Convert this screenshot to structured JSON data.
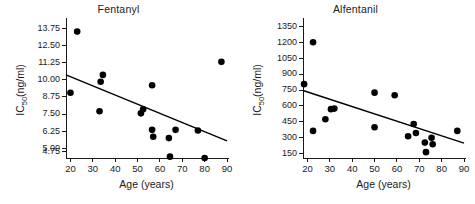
{
  "figure": {
    "background": "#ffffff",
    "marker_color": "#000000",
    "line_color": "#000000",
    "axis_color": "#1a1a1a"
  },
  "chart_data": [
    {
      "type": "scatter",
      "title": "Fentanyl",
      "xlabel": "Age (years)",
      "ylabel": "IC",
      "ylabel_sub": "50",
      "ylabel_unit": "(ng/ml)",
      "xlim": [
        18,
        90
      ],
      "ylim": [
        4.3,
        14.2
      ],
      "xticks": [
        20,
        30,
        40,
        50,
        60,
        70,
        80,
        90
      ],
      "xticklabels": [
        "20",
        "30",
        "40",
        "50",
        "60",
        "70",
        "80",
        "90"
      ],
      "yticks": [
        4.75,
        5.0,
        6.25,
        7.5,
        8.75,
        10.0,
        11.25,
        12.5,
        13.75
      ],
      "yticklabels": [
        "4.75",
        "5.00",
        "6.25",
        "7.50",
        "8.75",
        "10.00",
        "11.25",
        "12.50",
        "13.75"
      ],
      "grid": false,
      "legend": "none",
      "points": [
        {
          "x": 20.0,
          "y": 9.05
        },
        {
          "x": 23.0,
          "y": 13.5
        },
        {
          "x": 33.0,
          "y": 7.7
        },
        {
          "x": 33.5,
          "y": 9.85
        },
        {
          "x": 34.5,
          "y": 10.35
        },
        {
          "x": 51.5,
          "y": 7.55
        },
        {
          "x": 52.5,
          "y": 7.85
        },
        {
          "x": 56.5,
          "y": 9.6
        },
        {
          "x": 56.5,
          "y": 6.35
        },
        {
          "x": 57.0,
          "y": 5.85
        },
        {
          "x": 64.0,
          "y": 5.75
        },
        {
          "x": 64.5,
          "y": 4.4
        },
        {
          "x": 67.0,
          "y": 6.35
        },
        {
          "x": 77.0,
          "y": 6.3
        },
        {
          "x": 80.0,
          "y": 4.3
        },
        {
          "x": 87.5,
          "y": 11.3
        }
      ],
      "fit_line": {
        "x1": 18,
        "y1": 10.35,
        "x2": 90,
        "y2": 5.55
      }
    },
    {
      "type": "scatter",
      "title": "Alfentanil",
      "xlabel": "Age (years)",
      "ylabel": "IC",
      "ylabel_sub": "50",
      "ylabel_unit": "(ng/ml)",
      "xlim": [
        18,
        90
      ],
      "ylim": [
        110,
        1390
      ],
      "xticks": [
        20,
        30,
        40,
        50,
        60,
        70,
        80,
        90
      ],
      "xticklabels": [
        "20",
        "30",
        "40",
        "50",
        "60",
        "70",
        "80",
        "90"
      ],
      "yticks": [
        150,
        300,
        450,
        600,
        750,
        900,
        1050,
        1200,
        1350
      ],
      "yticklabels": [
        "150",
        "300",
        "450",
        "600",
        "750",
        "900",
        "1050",
        "1200",
        "1350"
      ],
      "grid": false,
      "legend": "none",
      "points": [
        {
          "x": 18.5,
          "y": 805
        },
        {
          "x": 22.5,
          "y": 1200
        },
        {
          "x": 22.5,
          "y": 365
        },
        {
          "x": 28.0,
          "y": 475
        },
        {
          "x": 30.5,
          "y": 570
        },
        {
          "x": 32.0,
          "y": 575
        },
        {
          "x": 50.0,
          "y": 725
        },
        {
          "x": 50.0,
          "y": 400
        },
        {
          "x": 59.0,
          "y": 700
        },
        {
          "x": 65.0,
          "y": 315
        },
        {
          "x": 67.5,
          "y": 430
        },
        {
          "x": 68.5,
          "y": 345
        },
        {
          "x": 72.5,
          "y": 255
        },
        {
          "x": 73.0,
          "y": 165
        },
        {
          "x": 75.5,
          "y": 300
        },
        {
          "x": 76.0,
          "y": 240
        },
        {
          "x": 87.0,
          "y": 365
        }
      ],
      "fit_line": {
        "x1": 18,
        "y1": 745,
        "x2": 90,
        "y2": 250
      }
    }
  ]
}
